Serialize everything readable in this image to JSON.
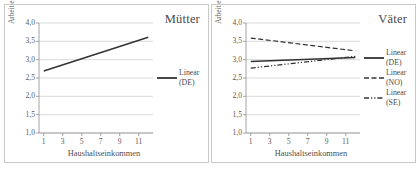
{
  "figure": {
    "panels": [
      {
        "id": "muetter",
        "title": "Mütter",
        "chart_data": {
          "type": "line",
          "title": "Mütter",
          "xlabel": "Haushaltseinkommen",
          "ylabel": "Arbeit egalitär",
          "xlim": [
            0.5,
            12.5
          ],
          "ylim": [
            1.0,
            4.0
          ],
          "xticks": [
            "1",
            "3",
            "5",
            "7",
            "9",
            "11"
          ],
          "xtick_values": [
            1,
            3,
            5,
            7,
            9,
            11
          ],
          "yticks": [
            "1,0",
            "1,5",
            "2,0",
            "2,5",
            "3,0",
            "3,5",
            "4,0"
          ],
          "ytick_values": [
            1.0,
            1.5,
            2.0,
            2.5,
            3.0,
            3.5,
            4.0
          ],
          "grid": "horizontal",
          "legend_position": "right",
          "series": [
            {
              "name": "Linear\n(DE)",
              "label_line1": "Linear",
              "label_line2": "(DE)",
              "style": "solid",
              "color": "#333333",
              "x": [
                1,
                12
              ],
              "values": [
                2.69,
                3.61
              ]
            }
          ]
        },
        "legend": [
          {
            "label": "Linear\n(DE)",
            "style": "solid",
            "color": "#333333"
          }
        ]
      },
      {
        "id": "vaeter",
        "title": "Väter",
        "chart_data": {
          "type": "line",
          "title": "Väter",
          "xlabel": "Haushaltseinkommen",
          "ylabel": "Arbeit egalitär",
          "xlim": [
            0.5,
            12.5
          ],
          "ylim": [
            1.0,
            4.0
          ],
          "xticks": [
            "1",
            "3",
            "5",
            "7",
            "9",
            "11"
          ],
          "xtick_values": [
            1,
            3,
            5,
            7,
            9,
            11
          ],
          "yticks": [
            "1,0",
            "1,5",
            "2,0",
            "2,5",
            "3,0",
            "3,5",
            "4,0"
          ],
          "ytick_values": [
            1.0,
            1.5,
            2.0,
            2.5,
            3.0,
            3.5,
            4.0
          ],
          "grid": "horizontal",
          "legend_position": "right",
          "series": [
            {
              "name": "Linear\n(DE)",
              "label_line1": "Linear",
              "label_line2": "(DE)",
              "style": "solid",
              "color": "#333333",
              "x": [
                1,
                12
              ],
              "values": [
                2.95,
                3.06
              ]
            },
            {
              "name": "Linear\n(NO)",
              "label_line1": "Linear",
              "label_line2": "(NO)",
              "style": "dashed",
              "color": "#333333",
              "x": [
                1,
                12
              ],
              "values": [
                3.59,
                3.24
              ]
            },
            {
              "name": "Linear\n(SE)",
              "label_line1": "Linear",
              "label_line2": "(SE)",
              "style": "dashdot",
              "color": "#333333",
              "x": [
                1,
                12
              ],
              "values": [
                2.77,
                3.09
              ]
            }
          ]
        },
        "legend": [
          {
            "label": "Linear\n(DE)",
            "style": "solid",
            "color": "#333333"
          },
          {
            "label": "Linear\n(NO)",
            "style": "dashed",
            "color": "#333333"
          },
          {
            "label": "Linear\n(SE)",
            "style": "dashdot",
            "color": "#333333"
          }
        ]
      }
    ],
    "colors": {
      "line": "#333333",
      "grid": "#cfcfcf",
      "axis": "#9a9a9a",
      "border": "#c8c8c8",
      "text": "#555555"
    }
  }
}
